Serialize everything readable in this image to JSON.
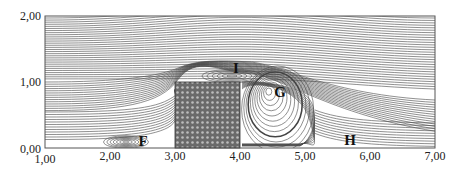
{
  "figure": {
    "type": "streamline flow around a square obstacle in a channel",
    "x_axis": {
      "ticks": [
        "1,00",
        "2,00",
        "3,00",
        "4,00",
        "5,00",
        "6,00",
        "7,00"
      ],
      "range": [
        1,
        7
      ]
    },
    "y_axis": {
      "ticks": [
        "2,00",
        "1,00",
        "0,00"
      ],
      "range": [
        0,
        2
      ]
    },
    "obstacle": {
      "x": [
        3,
        4
      ],
      "y": [
        0,
        1
      ],
      "fill": "hatched dark grey"
    },
    "vortex_labels": [
      {
        "id": "I",
        "text": "I",
        "x": 3.6,
        "y": 1.21
      },
      {
        "id": "G",
        "text": "G",
        "x": 4.6,
        "y": 0.85
      },
      {
        "id": "F",
        "text": "F",
        "x": 2.5,
        "y": 0.1
      },
      {
        "id": "H",
        "text": "H",
        "x": 5.7,
        "y": 0.12
      }
    ],
    "colors": {
      "lines": "#333333",
      "background": "#ffffff",
      "obstacle": "#555555"
    }
  }
}
